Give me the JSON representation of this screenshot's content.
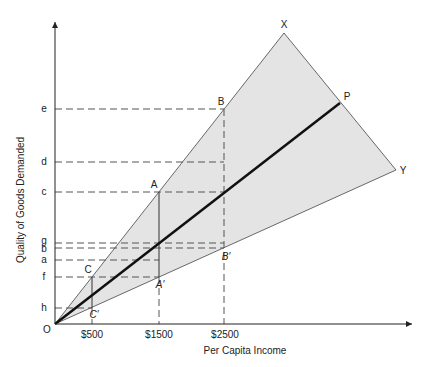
{
  "diagram": {
    "title": "",
    "xlabel": "Per Capita Income",
    "ylabel": "Quality of Goods Demanded",
    "origin_label": "O",
    "x_ticks": [
      {
        "label": "$500",
        "x": 92
      },
      {
        "label": "$1500",
        "x": 159
      },
      {
        "label": "$2500",
        "x": 225
      }
    ],
    "y_ticks": [
      {
        "label": "e",
        "y": 109
      },
      {
        "label": "d",
        "y": 162
      },
      {
        "label": "c",
        "y": 192
      },
      {
        "label": "g",
        "y": 243
      },
      {
        "label": "b",
        "y": 248
      },
      {
        "label": "a",
        "y": 260
      },
      {
        "label": "f",
        "y": 277
      },
      {
        "label": "h",
        "y": 308
      }
    ],
    "rays": {
      "upper": {
        "label": "X"
      },
      "middle": {
        "label": "P"
      },
      "lower": {
        "label": "Y"
      }
    },
    "points": {
      "B": "B",
      "A": "A",
      "C": "C",
      "B_prime": "B′",
      "A_prime": "A′",
      "C_prime": "C′"
    },
    "colors": {
      "fill": "#e4e4e4",
      "line": "#333333",
      "thick": "#111111",
      "dash": "#555555"
    }
  }
}
